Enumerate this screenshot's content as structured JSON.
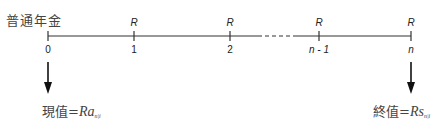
{
  "title": "普通年金",
  "timeline": {
    "points": [
      {
        "label": "0",
        "x": 48,
        "payment": "",
        "italic": false
      },
      {
        "label": "1",
        "x": 134,
        "payment": "R",
        "italic": false
      },
      {
        "label": "2",
        "x": 230,
        "payment": "R",
        "italic": false
      },
      {
        "label": "n - 1",
        "x": 319,
        "payment": "R",
        "italic": true
      },
      {
        "label": "n",
        "x": 411,
        "payment": "R",
        "italic": true
      }
    ],
    "dashed_segment": {
      "from": 258,
      "to": 297
    }
  },
  "present_value": {
    "label": "現值",
    "equals": "=",
    "formula_var": "Ra",
    "subscript": "n|i"
  },
  "future_value": {
    "label": "終值",
    "equals": "=",
    "formula_var": "Rs",
    "subscript": "n|i"
  },
  "colors": {
    "line": "#333333",
    "text": "#444444"
  }
}
